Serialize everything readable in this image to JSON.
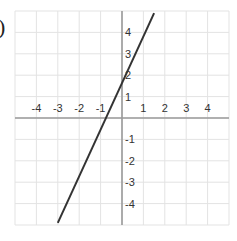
{
  "label_fragment": ")",
  "chart_data": {
    "type": "line",
    "title": "",
    "xlabel": "",
    "ylabel": "",
    "xlim": [
      -5,
      5
    ],
    "ylim": [
      -5,
      5
    ],
    "grid": true,
    "x_tick_labels": [
      "-4",
      "-3",
      "-2",
      "-1",
      "1",
      "2",
      "3",
      "4"
    ],
    "y_tick_labels": [
      "4",
      "3",
      "2",
      "1",
      "-1",
      "-2",
      "-3",
      "-4"
    ],
    "series": [
      {
        "name": "y = 2x + 2",
        "equation": "y = 2x + 2",
        "x": [
          -3.0,
          1.5
        ],
        "y": [
          -4.9,
          4.9
        ],
        "color": "#333333"
      }
    ],
    "key_points": [
      {
        "x": -1,
        "y": 0,
        "label": "x-intercept"
      },
      {
        "x": 0,
        "y": 2,
        "label": "y-intercept"
      }
    ]
  },
  "colors": {
    "grid": "#e3e3e3",
    "axis": "#9a9a9a",
    "line": "#333333",
    "text": "#333333"
  }
}
